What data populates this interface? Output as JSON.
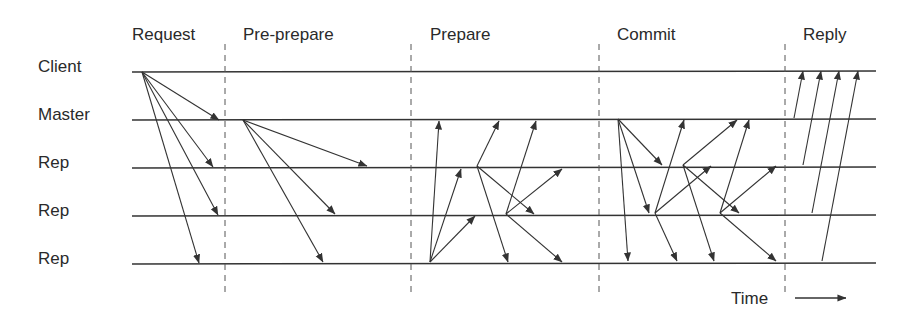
{
  "diagram": {
    "type": "sequence-diagram",
    "phases": [
      {
        "label": "Request",
        "x": 132
      },
      {
        "label": "Pre-prepare",
        "x": 243
      },
      {
        "label": "Prepare",
        "x": 430
      },
      {
        "label": "Commit",
        "x": 617
      },
      {
        "label": "Reply",
        "x": 803
      }
    ],
    "nodes": [
      {
        "label": "Client",
        "y": 72
      },
      {
        "label": "Master",
        "y": 120
      },
      {
        "label": "Rep",
        "y": 168
      },
      {
        "label": "Rep",
        "y": 216
      },
      {
        "label": "Rep",
        "y": 264
      }
    ],
    "phase_dividers_x": [
      225,
      411,
      599,
      785
    ],
    "time_label": "Time",
    "colors": {
      "line": "#333333",
      "text": "#2a2a2a",
      "background": "#ffffff"
    },
    "messages": [
      {
        "phase": "Request",
        "from": [
          142,
          72
        ],
        "to": [
          219,
          120
        ]
      },
      {
        "phase": "Request",
        "from": [
          142,
          72
        ],
        "to": [
          213,
          167
        ]
      },
      {
        "phase": "Request",
        "from": [
          142,
          72
        ],
        "to": [
          218,
          215
        ]
      },
      {
        "phase": "Request",
        "from": [
          142,
          72
        ],
        "to": [
          199,
          263
        ]
      },
      {
        "phase": "Pre-prepare",
        "from": [
          243,
          120
        ],
        "to": [
          367,
          166
        ]
      },
      {
        "phase": "Pre-prepare",
        "from": [
          243,
          120
        ],
        "to": [
          335,
          214
        ]
      },
      {
        "phase": "Pre-prepare",
        "from": [
          243,
          120
        ],
        "to": [
          323,
          262
        ]
      },
      {
        "phase": "Prepare",
        "from": [
          430,
          262
        ],
        "to": [
          439,
          121
        ]
      },
      {
        "phase": "Prepare",
        "from": [
          430,
          262
        ],
        "to": [
          461,
          169
        ]
      },
      {
        "phase": "Prepare",
        "from": [
          430,
          262
        ],
        "to": [
          475,
          216
        ]
      },
      {
        "phase": "Prepare",
        "from": [
          477,
          166
        ],
        "to": [
          499,
          121
        ]
      },
      {
        "phase": "Prepare",
        "from": [
          477,
          166
        ],
        "to": [
          534,
          214
        ]
      },
      {
        "phase": "Prepare",
        "from": [
          477,
          166
        ],
        "to": [
          508,
          262
        ]
      },
      {
        "phase": "Prepare",
        "from": [
          506,
          214
        ],
        "to": [
          536,
          121
        ]
      },
      {
        "phase": "Prepare",
        "from": [
          506,
          214
        ],
        "to": [
          562,
          169
        ]
      },
      {
        "phase": "Prepare",
        "from": [
          506,
          214
        ],
        "to": [
          562,
          262
        ]
      },
      {
        "phase": "Commit",
        "from": [
          618,
          119
        ],
        "to": [
          662,
          165
        ]
      },
      {
        "phase": "Commit",
        "from": [
          618,
          119
        ],
        "to": [
          649,
          213
        ]
      },
      {
        "phase": "Commit",
        "from": [
          618,
          119
        ],
        "to": [
          628,
          261
        ]
      },
      {
        "phase": "Commit",
        "from": [
          655,
          213
        ],
        "to": [
          684,
          120
        ]
      },
      {
        "phase": "Commit",
        "from": [
          655,
          213
        ],
        "to": [
          711,
          166
        ]
      },
      {
        "phase": "Commit",
        "from": [
          655,
          213
        ],
        "to": [
          677,
          261
        ]
      },
      {
        "phase": "Commit",
        "from": [
          683,
          165
        ],
        "to": [
          737,
          120
        ]
      },
      {
        "phase": "Commit",
        "from": [
          683,
          165
        ],
        "to": [
          739,
          213
        ]
      },
      {
        "phase": "Commit",
        "from": [
          683,
          165
        ],
        "to": [
          714,
          261
        ]
      },
      {
        "phase": "Commit",
        "from": [
          720,
          213
        ],
        "to": [
          749,
          120
        ]
      },
      {
        "phase": "Commit",
        "from": [
          720,
          213
        ],
        "to": [
          776,
          166
        ]
      },
      {
        "phase": "Commit",
        "from": [
          720,
          213
        ],
        "to": [
          776,
          261
        ]
      },
      {
        "phase": "Reply",
        "from": [
          794,
          118
        ],
        "to": [
          803,
          71
        ]
      },
      {
        "phase": "Reply",
        "from": [
          803,
          165
        ],
        "to": [
          821,
          71
        ]
      },
      {
        "phase": "Reply",
        "from": [
          812,
          213
        ],
        "to": [
          839,
          71
        ]
      },
      {
        "phase": "Reply",
        "from": [
          822,
          261
        ],
        "to": [
          858,
          71
        ]
      }
    ]
  }
}
